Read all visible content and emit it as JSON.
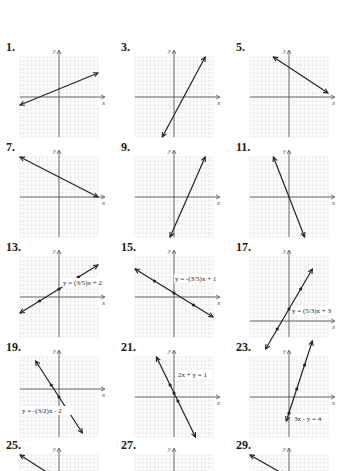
{
  "page": {
    "background": "#ffffff",
    "grid_color": "#dcdcdc",
    "axis_color": "#444444",
    "line_color": "#222222"
  },
  "chart_data": [
    {
      "type": "line",
      "label": "1.",
      "title": "",
      "xlabel": "x",
      "ylabel": "y",
      "xlim": [
        -10,
        10
      ],
      "ylim": [
        -10,
        10
      ],
      "grid": true,
      "series": [
        {
          "name": "line",
          "x": [
            -10,
            10
          ],
          "y": [
            -2,
            6
          ]
        }
      ],
      "annotation": ""
    },
    {
      "type": "line",
      "label": "3.",
      "title": "",
      "xlabel": "x",
      "ylabel": "y",
      "xlim": [
        -10,
        10
      ],
      "ylim": [
        -10,
        10
      ],
      "grid": true,
      "series": [
        {
          "name": "line",
          "x": [
            -3,
            8
          ],
          "y": [
            -10,
            10
          ]
        }
      ],
      "annotation": ""
    },
    {
      "type": "line",
      "label": "5.",
      "title": "",
      "xlabel": "x",
      "ylabel": "y",
      "xlim": [
        -10,
        10
      ],
      "ylim": [
        -10,
        10
      ],
      "grid": true,
      "series": [
        {
          "name": "line",
          "x": [
            -4,
            10
          ],
          "y": [
            10,
            1
          ]
        }
      ],
      "annotation": ""
    },
    {
      "type": "line",
      "label": "7.",
      "title": "",
      "xlabel": "x",
      "ylabel": "y",
      "xlim": [
        -10,
        10
      ],
      "ylim": [
        -10,
        10
      ],
      "grid": true,
      "series": [
        {
          "name": "line",
          "x": [
            -10,
            10
          ],
          "y": [
            10,
            0
          ]
        }
      ],
      "annotation": ""
    },
    {
      "type": "line",
      "label": "9.",
      "title": "",
      "xlabel": "x",
      "ylabel": "y",
      "xlim": [
        -10,
        10
      ],
      "ylim": [
        -10,
        10
      ],
      "grid": true,
      "series": [
        {
          "name": "line",
          "x": [
            -1,
            8
          ],
          "y": [
            -10,
            10
          ]
        }
      ],
      "annotation": ""
    },
    {
      "type": "line",
      "label": "11.",
      "title": "",
      "xlabel": "x",
      "ylabel": "y",
      "xlim": [
        -10,
        10
      ],
      "ylim": [
        -10,
        10
      ],
      "grid": true,
      "series": [
        {
          "name": "line",
          "x": [
            -4,
            4
          ],
          "y": [
            10,
            -10
          ]
        }
      ],
      "annotation": ""
    },
    {
      "type": "line",
      "label": "13.",
      "title": "",
      "xlabel": "x",
      "ylabel": "y",
      "xlim": [
        -10,
        10
      ],
      "ylim": [
        -10,
        10
      ],
      "grid": true,
      "series": [
        {
          "name": "line",
          "x": [
            -10,
            10
          ],
          "y": [
            -4,
            8
          ]
        }
      ],
      "points": [
        [
          0,
          2
        ],
        [
          5,
          5
        ],
        [
          -5,
          -1
        ]
      ],
      "annotation": "y = (3/5)x + 2"
    },
    {
      "type": "line",
      "label": "15.",
      "title": "",
      "xlabel": "x",
      "ylabel": "y",
      "xlim": [
        -10,
        10
      ],
      "ylim": [
        -10,
        10
      ],
      "grid": true,
      "series": [
        {
          "name": "line",
          "x": [
            -10,
            10
          ],
          "y": [
            7,
            -5
          ]
        }
      ],
      "points": [
        [
          0,
          1
        ],
        [
          -5,
          4
        ],
        [
          5,
          -2
        ]
      ],
      "annotation": "y = -(3/5)x + 1"
    },
    {
      "type": "line",
      "label": "17.",
      "title": "",
      "xlabel": "x",
      "ylabel": "y",
      "xlim": [
        -10,
        10
      ],
      "ylim": [
        -4,
        16
      ],
      "grid": true,
      "series": [
        {
          "name": "line",
          "x": [
            -6,
            6
          ],
          "y": [
            -7,
            13
          ]
        }
      ],
      "points": [
        [
          0,
          3
        ],
        [
          3,
          8
        ],
        [
          -3,
          -2
        ]
      ],
      "annotation": "y = (5/3)x + 3"
    },
    {
      "type": "line",
      "label": "19.",
      "title": "",
      "xlabel": "x",
      "ylabel": "y",
      "xlim": [
        -10,
        10
      ],
      "ylim": [
        -12,
        8
      ],
      "grid": true,
      "series": [
        {
          "name": "line",
          "x": [
            -6,
            6
          ],
          "y": [
            7,
            -11
          ]
        }
      ],
      "points": [
        [
          0,
          -2
        ],
        [
          -2,
          1
        ],
        [
          2,
          -5
        ]
      ],
      "annotation": "y = -(3/2)x - 2"
    },
    {
      "type": "line",
      "label": "21.",
      "title": "",
      "xlabel": "x",
      "ylabel": "y",
      "xlim": [
        -10,
        10
      ],
      "ylim": [
        -10,
        10
      ],
      "grid": true,
      "series": [
        {
          "name": "line",
          "x": [
            -4.5,
            5.5
          ],
          "y": [
            10,
            -10
          ]
        }
      ],
      "points": [
        [
          0,
          1
        ],
        [
          1,
          -1
        ],
        [
          -1,
          3
        ]
      ],
      "annotation": "2x + y = 1"
    },
    {
      "type": "line",
      "label": "23.",
      "title": "",
      "xlabel": "x",
      "ylabel": "y",
      "xlim": [
        -10,
        10
      ],
      "ylim": [
        -10,
        10
      ],
      "grid": true,
      "series": [
        {
          "name": "line",
          "x": [
            -0.7,
            6
          ],
          "y": [
            -6,
            14
          ]
        }
      ],
      "points": [
        [
          0,
          -4
        ],
        [
          2,
          2
        ],
        [
          4,
          8
        ]
      ],
      "annotation": "3x - y = 4"
    },
    {
      "type": "line",
      "label": "25.",
      "title": "",
      "xlabel": "",
      "ylabel": "y",
      "xlim": [
        -10,
        10
      ],
      "ylim": [
        -10,
        10
      ],
      "grid": true,
      "series": [
        {
          "name": "line",
          "x": [
            -10,
            -2
          ],
          "y": [
            10,
            5
          ]
        }
      ],
      "annotation": ""
    },
    {
      "type": "line",
      "label": "27.",
      "title": "",
      "xlabel": "",
      "ylabel": "y",
      "xlim": [
        -10,
        10
      ],
      "ylim": [
        -10,
        10
      ],
      "grid": true,
      "series": [],
      "annotation": ""
    },
    {
      "type": "line",
      "label": "29.",
      "title": "",
      "xlabel": "",
      "ylabel": "y",
      "xlim": [
        -10,
        10
      ],
      "ylim": [
        -10,
        10
      ],
      "grid": true,
      "series": [
        {
          "name": "line",
          "x": [
            -10,
            -1
          ],
          "y": [
            10,
            5
          ]
        }
      ],
      "annotation": ""
    }
  ]
}
